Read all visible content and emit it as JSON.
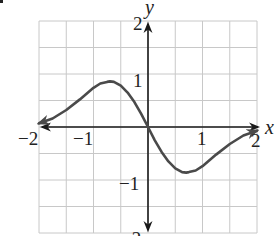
{
  "chart_data": {
    "type": "line",
    "title": "",
    "xlabel": "x",
    "ylabel": "y",
    "xlim": [
      -2,
      2
    ],
    "ylim": [
      -2,
      2
    ],
    "grid": true,
    "grid_step": 0.5,
    "x_ticks": [
      -2,
      -1,
      1,
      2
    ],
    "y_ticks": [
      2,
      1,
      -1,
      -2
    ],
    "x_tick_labels": [
      "−2",
      "−1",
      "1",
      "2"
    ],
    "y_tick_labels": [
      "2",
      "1",
      "−1",
      "−2"
    ],
    "series": [
      {
        "name": "f(x)",
        "arrows_both_ends": true,
        "x": [
          -2.0,
          -1.75,
          -1.5,
          -1.25,
          -1.0,
          -0.875,
          -0.75,
          -0.7,
          -0.625,
          -0.5,
          -0.375,
          -0.25,
          -0.125,
          0.0,
          0.125,
          0.25,
          0.375,
          0.5,
          0.625,
          0.7,
          0.75,
          0.875,
          1.0,
          1.25,
          1.5,
          1.75,
          2.0
        ],
        "y": [
          0.07,
          0.16,
          0.32,
          0.52,
          0.74,
          0.82,
          0.85,
          0.86,
          0.85,
          0.78,
          0.65,
          0.47,
          0.25,
          0.0,
          -0.25,
          -0.47,
          -0.65,
          -0.78,
          -0.85,
          -0.86,
          -0.85,
          -0.82,
          -0.74,
          -0.52,
          -0.32,
          -0.16,
          -0.07
        ]
      }
    ],
    "extrema": {
      "local_max": {
        "x": -0.7,
        "y": 0.86
      },
      "local_min": {
        "x": 0.7,
        "y": -0.86
      }
    },
    "legend": null
  },
  "labels": {
    "x_axis": "x",
    "y_axis": "y",
    "x_neg2": "−2",
    "x_neg1": "−1",
    "x_pos1": "1",
    "x_pos2": "2",
    "y_pos2": "2",
    "y_pos1": "1",
    "y_neg1": "−1",
    "y_neg2": "−2"
  },
  "colors": {
    "curve": "#4a4a4a",
    "axis": "#1a1a1a",
    "grid": "#c8c8c8",
    "background": "#ffffff"
  }
}
